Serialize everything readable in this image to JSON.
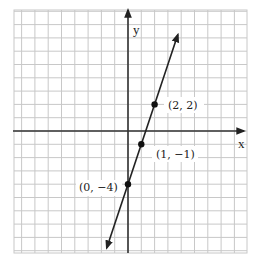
{
  "diagram": {
    "type": "coordinate-plane-line-graph",
    "axes": {
      "x_label": "x",
      "y_label": "y"
    },
    "line": {
      "equation": "y = 3x - 4",
      "slope": 3,
      "intercept": -4
    },
    "points": [
      {
        "x": 2,
        "y": 2,
        "label": "(2, 2)"
      },
      {
        "x": 1,
        "y": -1,
        "label": "(1, −1)"
      },
      {
        "x": 0,
        "y": -4,
        "label": "(0, −4)"
      }
    ],
    "colors": {
      "grid": "#c8c8c8",
      "axis": "#333333",
      "line": "#222222",
      "point": "#111111"
    }
  }
}
